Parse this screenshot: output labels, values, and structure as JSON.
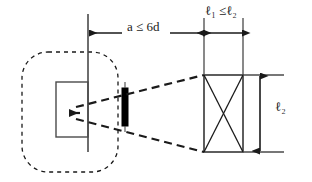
{
  "diagram": {
    "background_color": "#ffffff",
    "stroke_color": "#1a1a1a",
    "fill_black": "#000000",
    "labels": {
      "spacing_a": "a ≤ 6d",
      "length_l1_l2": "ℓ₁ ≤ℓ₂",
      "length_l2": "ℓ₂"
    },
    "annotations": {
      "spacing_a_symbol": "a",
      "spacing_a_relation": "≤",
      "spacing_a_value": "6d",
      "l1_symbol": "ℓ",
      "l1_subscript": "1",
      "l2_symbol": "ℓ",
      "l2_subscript": "2",
      "relation": "≤"
    },
    "shapes": {
      "outer_dashed_rounded_rect": {
        "name": "dashed-rounded-boundary",
        "x": 22,
        "y": 52,
        "width": 96,
        "height": 120,
        "radius": 26,
        "style": "dashed"
      },
      "inner_solid_rect": {
        "name": "inner-member-rect",
        "x": 56,
        "y": 82,
        "width": 32,
        "height": 55,
        "style": "solid"
      },
      "vertical_reference_line": {
        "name": "left-reference-line",
        "x": 88,
        "y1": 14,
        "y2": 152
      },
      "black_bar": {
        "name": "solid-black-plate",
        "x": 122,
        "y": 88,
        "width": 6,
        "height": 38,
        "fill": "#000000"
      },
      "right_rect_with_cross": {
        "name": "braced-panel-rect",
        "x": 204,
        "y": 75,
        "width": 39,
        "height": 77,
        "style": "solid",
        "cross": true
      },
      "right_extension_line_top": {
        "x1": 204,
        "y1": 18,
        "x2": 204,
        "y2": 75
      },
      "right_extension_line_bottom": {
        "x1": 243,
        "y1": 18,
        "x2": 243,
        "y2": 75
      }
    },
    "dimensions": {
      "horizontal_a": {
        "name": "dimension-a-6d",
        "y": 33,
        "x_start": 88,
        "x_end": 204,
        "arrow_left": true,
        "arrow_right": true
      },
      "horizontal_l1": {
        "name": "dimension-l1",
        "y": 33,
        "x_start": 205,
        "x_end": 243,
        "arrow_left": true,
        "arrow_right": true
      },
      "vertical_l2": {
        "name": "dimension-l2",
        "x": 260,
        "y_start": 75,
        "y_end": 152,
        "arrow_top": true,
        "arrow_bottom": true
      }
    },
    "dashed_sight_lines": {
      "name": "sight-cone-lines",
      "apex": {
        "x": 70,
        "y": 113
      },
      "upper_end": {
        "x": 204,
        "y": 75
      },
      "lower_end": {
        "x": 204,
        "y": 152
      },
      "style": "dashed"
    }
  }
}
